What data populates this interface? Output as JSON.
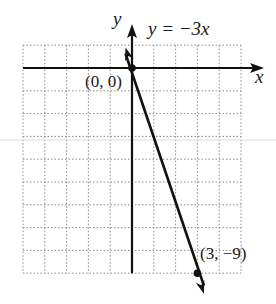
{
  "chart_data": {
    "type": "line",
    "title": "y = −3x",
    "xlabel": "x",
    "ylabel": "y",
    "xlim": [
      -5,
      5
    ],
    "ylim": [
      -9,
      1
    ],
    "grid": true,
    "grid_style": "dotted",
    "series": [
      {
        "name": "y = −3x",
        "x": [
          0,
          3
        ],
        "y": [
          0,
          -9
        ],
        "color": "#111111"
      }
    ],
    "annotations": [
      {
        "text": "(0, 0)",
        "x": 0,
        "y": 0
      },
      {
        "text": "(3, −9)",
        "x": 3,
        "y": -9
      }
    ]
  },
  "labels": {
    "equation": "y = −3x",
    "x_axis": "x",
    "y_axis": "y",
    "point_origin": "(0, 0)",
    "point_second": "(3, −9)"
  }
}
